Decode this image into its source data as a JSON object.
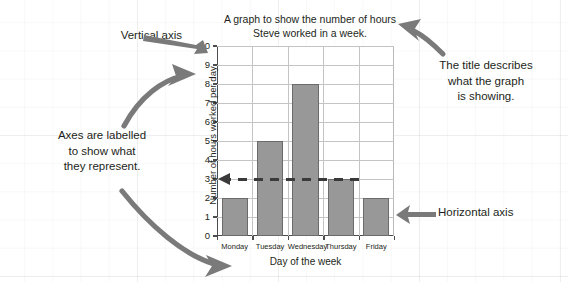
{
  "chart_data": {
    "type": "bar",
    "title": "A graph to show the number of hours Steve worked in a week.",
    "title_line1": "A graph to show the number of hours",
    "title_line2": "Steve worked in a week.",
    "categories": [
      "Monday",
      "Tuesday",
      "Wednesday",
      "Thursday",
      "Friday"
    ],
    "values": [
      2,
      5,
      8,
      3,
      2
    ],
    "xlabel": "Day of the week",
    "ylabel": "Number of hours worked per day",
    "ylim": [
      0,
      10
    ],
    "yticks": [
      0,
      1,
      2,
      3,
      4,
      5,
      6,
      7,
      8,
      9,
      10
    ],
    "ytick_labels": [
      "0",
      "1",
      "2",
      "3",
      "4",
      "5",
      "6",
      "7",
      "8",
      "9",
      "10"
    ],
    "grid": true,
    "legend": false,
    "bar_color": "#989898",
    "bar_edge_color": "#6b6b6b",
    "annotation_guide_value": 3
  },
  "annotations": {
    "vertical_axis": "Vertical axis",
    "horizontal_axis": "Horizontal axis",
    "axes_labelled_line1": "Axes are labelled",
    "axes_labelled_line2": "to show what",
    "axes_labelled_line3": "they represent.",
    "title_describes_line1": "The title describes",
    "title_describes_line2": "what the graph",
    "title_describes_line3": "is showing."
  },
  "colors": {
    "text": "#231f20",
    "arrow": "#7a7a7a",
    "axis": "#4d4d4d",
    "gridline": "#c4c4c4",
    "background": "#ffffff"
  }
}
